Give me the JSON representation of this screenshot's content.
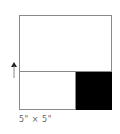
{
  "diagram": {
    "size_label": "5\" × 5\"",
    "colors": {
      "border": "#8a8a8a",
      "fill_region": "#000000",
      "background": "#ffffff"
    },
    "regions": [
      {
        "name": "top",
        "fill": "#ffffff"
      },
      {
        "name": "bottom-left",
        "fill": "#ffffff"
      },
      {
        "name": "bottom-right",
        "fill": "#000000"
      }
    ],
    "arrow": {
      "direction": "up"
    }
  }
}
